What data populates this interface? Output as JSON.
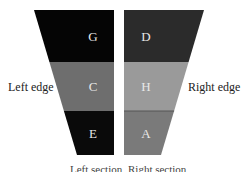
{
  "diagram": {
    "left_shape": {
      "cells": [
        {
          "label": "G",
          "color": "#050505"
        },
        {
          "label": "C",
          "color": "#6e6e6e"
        },
        {
          "label": "E",
          "color": "#0a0a0a"
        }
      ]
    },
    "right_shape": {
      "cells": [
        {
          "label": "D",
          "color": "#2b2b2b"
        },
        {
          "label": "H",
          "color": "#9a9a9a"
        },
        {
          "label": "A",
          "color": "#7a7a7a"
        }
      ]
    },
    "left_edge_label": "Left edge",
    "right_edge_label": "Right edge",
    "bottom_left_label": "Left section",
    "bottom_right_label": "Right section"
  }
}
